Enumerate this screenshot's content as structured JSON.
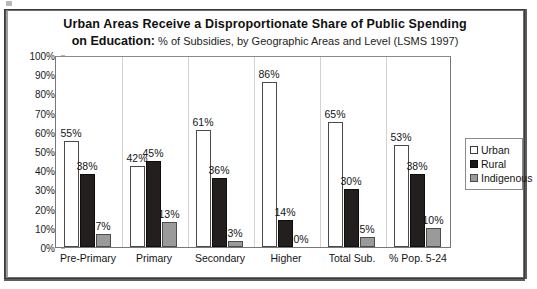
{
  "chart_data": {
    "type": "bar",
    "title": "Urban Areas Receive a Disproportionate Share of Public Spending on Education: % of Subsidies, by Geographic Areas and Level (LSMS 1997)",
    "title_line1": "Urban Areas Receive a Disproportionate Share of Public Spending",
    "title_line2_bold": "on Education:",
    "title_line2_rest": " % of Subsidies, by Geographic Areas and Level (LSMS 1997)",
    "xlabel": "",
    "ylabel": "",
    "ylim": [
      0,
      100
    ],
    "grid": false,
    "legend_position": "right",
    "categories": [
      "Pre-Primary",
      "Primary",
      "Secondary",
      "Higher",
      "Total Sub.",
      "% Pop. 5-24"
    ],
    "ytick_labels": [
      "100%",
      "90%",
      "80%",
      "70%",
      "60%",
      "50%",
      "40%",
      "30%",
      "20%",
      "10%",
      "0%"
    ],
    "ytick_values": [
      100,
      90,
      80,
      70,
      60,
      50,
      40,
      30,
      20,
      10,
      0
    ],
    "series": [
      {
        "name": "Urban",
        "color": "#ffffff",
        "values": [
          55,
          42,
          61,
          86,
          65,
          53
        ],
        "labels": [
          "55%",
          "42%",
          "61%",
          "86%",
          "65%",
          "53%"
        ]
      },
      {
        "name": "Rural",
        "color": "#231f1f",
        "values": [
          38,
          45,
          36,
          14,
          30,
          38
        ],
        "labels": [
          "38%",
          "45%",
          "36%",
          "14%",
          "30%",
          "38%"
        ]
      },
      {
        "name": "Indigenous",
        "color": "#9a9a9a",
        "values": [
          7,
          13,
          3,
          0,
          5,
          10
        ],
        "labels": [
          "7%",
          "13%",
          "3%",
          "0%",
          "5%",
          "10%"
        ]
      }
    ]
  }
}
